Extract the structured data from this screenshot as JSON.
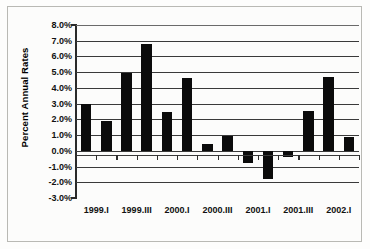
{
  "chart_data": {
    "type": "bar",
    "title": "",
    "subtitle": "",
    "xlabel": "",
    "ylabel": "Percent Annual Rates",
    "ylim": [
      -3.0,
      8.0
    ],
    "ytick_values": [
      8.0,
      7.0,
      6.0,
      5.0,
      4.0,
      3.0,
      2.0,
      1.0,
      0.0,
      -1.0,
      -2.0,
      -3.0
    ],
    "ytick_labels": [
      "8.0%",
      "7.0%",
      "6.0%",
      "5.0%",
      "4.0%",
      "3.0%",
      "2.0%",
      "1.0%",
      "0.0%",
      "-1.0%",
      "-2.0%",
      "-3.0%"
    ],
    "grid": true,
    "grid_axis": "y",
    "legend": false,
    "legend_position": "none",
    "bar_color": "#0b0b0b",
    "categories": [
      "1999.I",
      "1999.II",
      "1999.III",
      "1999.IV",
      "2000.I",
      "2000.II",
      "2000.III",
      "2000.IV",
      "2001.I",
      "2001.II",
      "2001.III",
      "2001.IV",
      "2002.I",
      "2002.II"
    ],
    "xtick_labels": [
      "1999.I",
      "1999.III",
      "2000.I",
      "2000.III",
      "2001.I",
      "2001.III",
      "2002.I"
    ],
    "xtick_category_indices": [
      0,
      2,
      4,
      6,
      8,
      10,
      12
    ],
    "values": [
      3.0,
      1.9,
      4.95,
      6.8,
      2.45,
      4.6,
      0.45,
      0.95,
      -0.8,
      -1.8,
      -0.4,
      2.55,
      4.7,
      0.85
    ],
    "units": "percent"
  },
  "figure": {
    "y_axis_title": "Percent Annual Rates"
  }
}
